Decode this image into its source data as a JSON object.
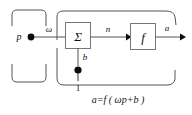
{
  "figure": {
    "type": "block-diagram"
  },
  "labels": {
    "input": "p",
    "weight": "ω",
    "net_input": "n",
    "bias": "b",
    "bias_source": "1",
    "output": "a",
    "sum_block": "Σ",
    "transfer_block": "f",
    "equation": "a=f ( ωp+b )"
  },
  "groups": {
    "left_group_name": "input-group",
    "right_group_name": "neuron-group"
  },
  "colors": {
    "line": "#555555",
    "box_border": "#777777",
    "text": "#111111",
    "dot": "#0b0b0b",
    "background": "#ffffff"
  }
}
